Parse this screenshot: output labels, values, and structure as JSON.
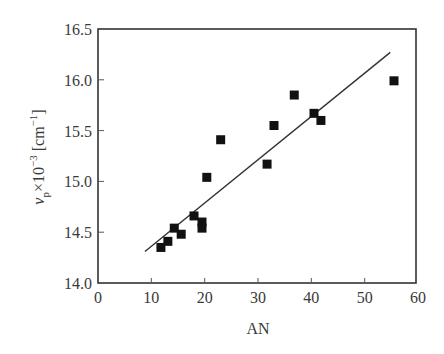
{
  "chart_data": {
    "type": "scatter",
    "title": "",
    "xlabel": "AN",
    "ylabel": "ν_p × 10^-3 [cm^-1]",
    "ylabel_parts": {
      "symbol": "ν",
      "subscript": "p",
      "times": "×10",
      "exponent": "−3",
      "unit_open": "[cm",
      "unit_exp": "−1",
      "unit_close": "]"
    },
    "xlim": [
      0,
      60
    ],
    "ylim": [
      14.0,
      16.5
    ],
    "xticks": [
      0,
      10,
      20,
      30,
      40,
      50,
      60
    ],
    "yticks": [
      14.0,
      14.5,
      15.0,
      15.5,
      16.0,
      16.5
    ],
    "ytick_labels": [
      "14.0",
      "14.5",
      "15.0",
      "15.5",
      "16.0",
      "16.5"
    ],
    "grid": false,
    "legend": null,
    "marker": "filled-square",
    "series": [
      {
        "name": "data",
        "points": [
          {
            "x": 11.8,
            "y": 14.35
          },
          {
            "x": 13.1,
            "y": 14.41
          },
          {
            "x": 14.3,
            "y": 14.54
          },
          {
            "x": 15.6,
            "y": 14.48
          },
          {
            "x": 18.0,
            "y": 14.66
          },
          {
            "x": 19.5,
            "y": 14.6
          },
          {
            "x": 19.5,
            "y": 14.54
          },
          {
            "x": 20.4,
            "y": 15.04
          },
          {
            "x": 23.0,
            "y": 15.41
          },
          {
            "x": 31.7,
            "y": 15.17
          },
          {
            "x": 33.0,
            "y": 15.55
          },
          {
            "x": 36.8,
            "y": 15.85
          },
          {
            "x": 40.5,
            "y": 15.67
          },
          {
            "x": 41.8,
            "y": 15.6
          },
          {
            "x": 55.5,
            "y": 15.99
          }
        ]
      }
    ],
    "fit_line": {
      "x": [
        8.8,
        54.8
      ],
      "y": [
        14.31,
        16.27
      ]
    }
  }
}
